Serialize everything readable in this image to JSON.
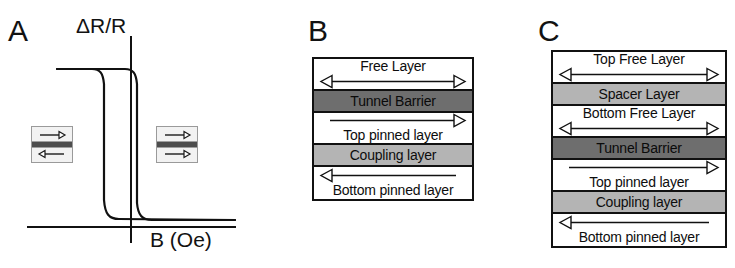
{
  "figure": {
    "panels": [
      {
        "letter": "A"
      },
      {
        "letter": "B"
      },
      {
        "letter": "C"
      }
    ]
  },
  "panel_a": {
    "letter": "A",
    "ylabel": "ΔR/R",
    "xlabel": "B (Oe)",
    "state_left": {
      "name": "antiparallel-state",
      "top_arrow": "right",
      "bottom_arrow": "left"
    },
    "state_right": {
      "name": "parallel-state",
      "top_arrow": "right",
      "bottom_arrow": "right"
    }
  },
  "panel_b": {
    "letter": "B",
    "layers": [
      {
        "label": "Free Layer",
        "shade": "white",
        "arrow": "double",
        "arrow_position": "below"
      },
      {
        "label": "Tunnel Barrier",
        "shade": "darkgray",
        "arrow": "none",
        "arrow_position": "none"
      },
      {
        "label": "Top pinned layer",
        "shade": "white",
        "arrow": "right",
        "arrow_position": "above"
      },
      {
        "label": "Coupling layer",
        "shade": "midgray",
        "arrow": "none",
        "arrow_position": "none"
      },
      {
        "label": "Bottom pinned layer",
        "shade": "white",
        "arrow": "left",
        "arrow_position": "above"
      }
    ]
  },
  "panel_c": {
    "letter": "C",
    "layers": [
      {
        "label": "Top Free Layer",
        "shade": "white",
        "arrow": "double",
        "arrow_position": "below"
      },
      {
        "label": "Spacer Layer",
        "shade": "midgray",
        "arrow": "none",
        "arrow_position": "none"
      },
      {
        "label": "Bottom Free Layer",
        "shade": "white",
        "arrow": "double",
        "arrow_position": "below"
      },
      {
        "label": "Tunnel Barrier",
        "shade": "darkgray",
        "arrow": "none",
        "arrow_position": "none"
      },
      {
        "label": "Top pinned layer",
        "shade": "white",
        "arrow": "right",
        "arrow_position": "above"
      },
      {
        "label": "Coupling layer",
        "shade": "midgray",
        "arrow": "none",
        "arrow_position": "none"
      },
      {
        "label": "Bottom pinned layer",
        "shade": "white",
        "arrow": "left",
        "arrow_position": "above"
      }
    ]
  },
  "chart_data": {
    "type": "line",
    "title": "",
    "xlabel": "B (Oe)",
    "ylabel": "ΔR/R",
    "grid": false,
    "legend": null,
    "axis_ticks": {
      "x": [],
      "y": []
    },
    "series": [
      {
        "name": "descending-branch",
        "points": [
          [
            -1.0,
            1.0
          ],
          [
            -0.55,
            1.0
          ],
          [
            -0.46,
            0.98
          ],
          [
            -0.42,
            0.86
          ],
          [
            -0.4,
            0.55
          ],
          [
            -0.4,
            0.2
          ],
          [
            -0.39,
            0.06
          ],
          [
            -0.35,
            0.01
          ],
          [
            -0.25,
            0.0
          ],
          [
            0.45,
            0.0
          ]
        ]
      },
      {
        "name": "ascending-branch",
        "points": [
          [
            0.45,
            0.0
          ],
          [
            0.05,
            0.0
          ],
          [
            -0.02,
            0.02
          ],
          [
            -0.05,
            0.12
          ],
          [
            -0.06,
            0.45
          ],
          [
            -0.06,
            0.8
          ],
          [
            -0.04,
            0.95
          ],
          [
            0.0,
            0.99
          ],
          [
            0.1,
            1.0
          ],
          [
            0.55,
            1.0
          ]
        ]
      }
    ],
    "annotations": [
      {
        "label": "antiparallel-state-icon",
        "x": -0.62,
        "y": 0.5
      },
      {
        "label": "parallel-state-icon",
        "x": 0.3,
        "y": 0.5
      }
    ]
  }
}
